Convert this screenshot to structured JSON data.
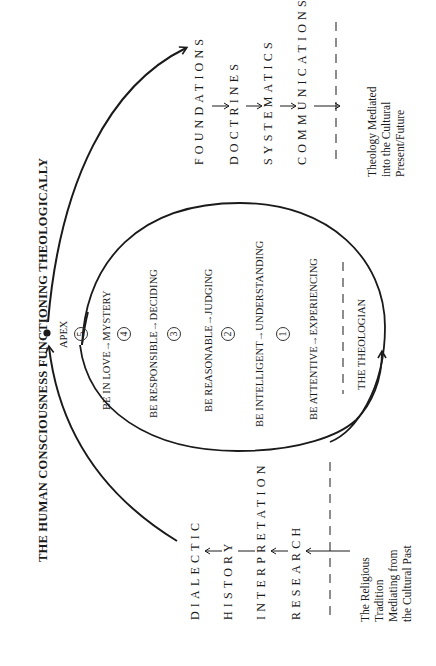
{
  "title": "THE HUMAN CONSCIOUSNESS FUNCTIONING THEOLOGICALLY",
  "apex": {
    "label": "APEX",
    "number": "5"
  },
  "levels": [
    {
      "number": "4",
      "label": "BE IN LOVE→MYSTERY"
    },
    {
      "number": "3",
      "label": "BE RESPONSIBLE→DECIDING"
    },
    {
      "number": "2",
      "label": "BE REASONABLE→JUDGING"
    },
    {
      "number": "",
      "label": "BE INTELLIGENT→UNDERSTANDING"
    },
    {
      "number": "1",
      "label": "BE ATTENTIVE→EXPERIENCING"
    }
  ],
  "circle_numbers": [
    "5",
    "4",
    "3",
    "2",
    "1"
  ],
  "theologian": "THE THEOLOGIAN",
  "mediating_phase": {
    "specialties": [
      "DIALECTIC",
      "HISTORY",
      "INTERPRETATION",
      "RESEARCH"
    ],
    "caption": "The Religious\nTradition\nMediating from\nthe Cultural Past"
  },
  "mediated_phase": {
    "specialties": [
      "FOUNDATIONS",
      "DOCTRINES",
      "SYSTEMATICS",
      "COMMUNICATIONS"
    ],
    "caption": "Theology Mediated\ninto the Cultural\nPresent/Future"
  },
  "colors": {
    "ink": "#1a1a1a",
    "background": "#ffffff"
  }
}
